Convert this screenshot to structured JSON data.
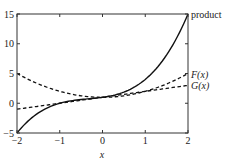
{
  "chart_data": {
    "type": "line",
    "title": "",
    "xlabel": "x",
    "ylabel": "",
    "xlim": [
      -2,
      2
    ],
    "ylim": [
      -5,
      15
    ],
    "x_ticks": [
      -2,
      -1,
      0,
      1,
      2
    ],
    "x_tick_labels": [
      "−2",
      "−1",
      "0",
      "1",
      "2"
    ],
    "y_ticks": [
      -5,
      0,
      5,
      10,
      15
    ],
    "y_tick_labels": [
      "−5",
      "0",
      "5",
      "10",
      "15"
    ],
    "grid": false,
    "legend": "inline labels at right edge",
    "x": [
      -2,
      -1.5,
      -1,
      -0.5,
      0,
      0.5,
      1,
      1.5,
      2
    ],
    "series": [
      {
        "name": "product",
        "style": "solid",
        "values": [
          -5,
          -1.625,
          0,
          0.625,
          1,
          1.875,
          4,
          8.125,
          15
        ]
      },
      {
        "name": "F(x)",
        "style": "dashed",
        "values": [
          5,
          3.25,
          2,
          1.25,
          1,
          1.25,
          2,
          3.25,
          5
        ]
      },
      {
        "name": "G(x)",
        "style": "dashed",
        "values": [
          -1,
          -0.5,
          0,
          0.5,
          1,
          1.5,
          2,
          2.5,
          3
        ]
      }
    ],
    "labels": {
      "product": "product",
      "F": "F(x)",
      "G": "G(x)"
    }
  }
}
